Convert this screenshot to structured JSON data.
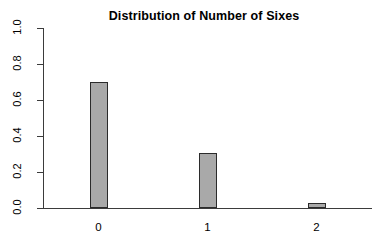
{
  "chart_data": {
    "type": "bar",
    "title": "Distribution of Number of Sixes",
    "xlabel": "",
    "ylabel": "",
    "categories": [
      "0",
      "1",
      "2"
    ],
    "values": [
      0.7,
      0.305,
      0.027
    ],
    "ylim": [
      0.0,
      1.0
    ],
    "yticks": [
      "0.0",
      "0.2",
      "0.4",
      "0.6",
      "0.8",
      "1.0"
    ],
    "ytick_values": [
      0.0,
      0.2,
      0.4,
      0.6,
      0.8,
      1.0
    ],
    "xticks": [
      "0",
      "1",
      "2"
    ],
    "grid": false,
    "legend": null,
    "bar_fill_color": "#a9a9a9",
    "bar_border_color": "#2b2b2b",
    "axis_color": "#3b3b3b",
    "background_color": "#ffffff",
    "text_color": "#000000"
  }
}
